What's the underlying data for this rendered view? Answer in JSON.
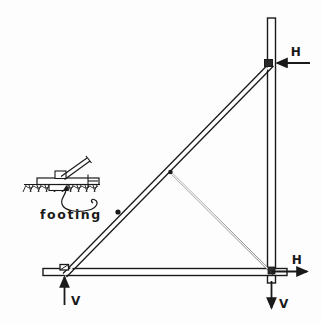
{
  "figure": {
    "type": "structural-truss-diagram",
    "background_color": "#fdfdfd",
    "line_color": "#1a1a1a",
    "width": 321,
    "height": 324
  },
  "labels": {
    "footing": "footing",
    "force_h_top": "H",
    "force_h_bottom": "H",
    "force_v_left": "V",
    "force_v_right": "V"
  },
  "geometry": {
    "mast_top": [
      271.5,
      18
    ],
    "mast_bottom": [
      271.5,
      283
    ],
    "apex_joint": [
      271.5,
      64
    ],
    "bottom_left_joint": [
      64,
      272
    ],
    "bottom_right_joint": [
      271.5,
      272
    ],
    "mid_node": [
      170,
      172
    ],
    "diagonal_marker": [
      118,
      212
    ],
    "chord_left_end": [
      43,
      272
    ],
    "chord_right_end": [
      287,
      272
    ]
  },
  "forces": {
    "h_top": {
      "label": "H",
      "direction": "left",
      "applied_at": "apex-joint"
    },
    "h_bottom": {
      "label": "H",
      "direction": "right",
      "applied_at": "bottom-right-joint"
    },
    "v_left": {
      "label": "V",
      "direction": "up",
      "applied_at": "bottom-left-joint"
    },
    "v_right": {
      "label": "V",
      "direction": "down",
      "applied_at": "bottom-right-joint"
    }
  }
}
